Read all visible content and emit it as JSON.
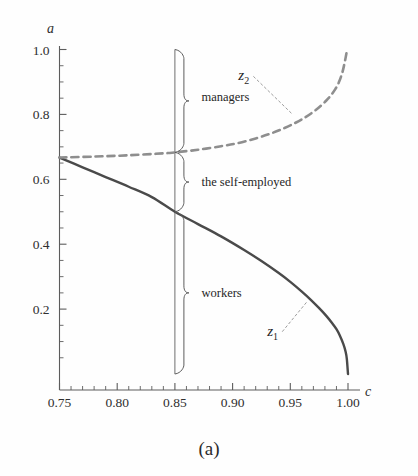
{
  "figure": {
    "caption": "(a)",
    "background_color": "#fefefe"
  },
  "chart_data": {
    "type": "line",
    "title": "",
    "xlabel": "c",
    "ylabel": "a",
    "xlim": [
      0.75,
      1.0
    ],
    "ylim": [
      0.0,
      1.0
    ],
    "grid": false,
    "legend_position": "inline-annotations",
    "x_ticks": [
      0.75,
      0.8,
      0.85,
      0.9,
      0.95,
      1.0
    ],
    "x_tick_labels": [
      "0.75",
      "0.80",
      "0.85",
      "0.90",
      "0.95",
      "1.00"
    ],
    "x_minor_step": 0.01,
    "y_ticks": [
      0.2,
      0.4,
      0.6,
      0.8,
      1.0
    ],
    "y_tick_labels": [
      "0.2",
      "0.4",
      "0.6",
      "0.8",
      "1.0"
    ],
    "y_minor_step": 0.05,
    "series": [
      {
        "name": "z1",
        "label": "z",
        "subscript": "1",
        "style": "solid",
        "color": "#4a4a4a",
        "width": 2.4,
        "x": [
          0.75,
          0.77,
          0.79,
          0.81,
          0.83,
          0.85,
          0.87,
          0.89,
          0.91,
          0.925,
          0.94,
          0.95,
          0.96,
          0.968,
          0.975,
          0.981,
          0.986,
          0.99,
          0.993,
          0.996,
          0.998,
          0.999,
          1.0
        ],
        "y": [
          0.667,
          0.637,
          0.607,
          0.577,
          0.545,
          0.5,
          0.462,
          0.424,
          0.382,
          0.348,
          0.311,
          0.284,
          0.254,
          0.228,
          0.203,
          0.18,
          0.158,
          0.138,
          0.118,
          0.092,
          0.068,
          0.046,
          0.0
        ]
      },
      {
        "name": "z2",
        "label": "z",
        "subscript": "2",
        "style": "dashed",
        "color": "#8e8e8e",
        "width": 2.6,
        "x": [
          0.75,
          0.78,
          0.81,
          0.84,
          0.85,
          0.87,
          0.89,
          0.905,
          0.92,
          0.933,
          0.945,
          0.955,
          0.963,
          0.97,
          0.976,
          0.981,
          0.985,
          0.989,
          0.992,
          0.995,
          0.997,
          0.999
        ],
        "y": [
          0.667,
          0.67,
          0.674,
          0.68,
          0.683,
          0.691,
          0.702,
          0.712,
          0.726,
          0.741,
          0.758,
          0.775,
          0.791,
          0.808,
          0.825,
          0.842,
          0.858,
          0.878,
          0.898,
          0.928,
          0.958,
          0.995
        ]
      }
    ],
    "vertical_line": {
      "name": "c-threshold",
      "x": 0.85,
      "y_from": 0.0,
      "y_to": 1.0,
      "color": "#6f6f6f"
    },
    "annotations": [
      {
        "name": "managers",
        "text": "managers",
        "brace_x": 0.85,
        "brace_y_from": 0.683,
        "brace_y_to": 1.0,
        "label_x": 0.873,
        "label_y": 0.855
      },
      {
        "name": "the-self-employed",
        "text": "the self-employed",
        "brace_x": 0.85,
        "brace_y_from": 0.5,
        "brace_y_to": 0.683,
        "label_x": 0.873,
        "label_y": 0.592
      },
      {
        "name": "workers",
        "text": "workers",
        "brace_x": 0.85,
        "brace_y_from": 0.0,
        "brace_y_to": 0.5,
        "label_x": 0.873,
        "label_y": 0.25
      }
    ],
    "curve_labels": [
      {
        "name": "z2-label",
        "label": "z",
        "subscript": "2",
        "label_x": 0.905,
        "label_y": 0.905,
        "leader_to_x": 0.952,
        "leader_to_y": 0.8
      },
      {
        "name": "z1-label",
        "label": "z",
        "subscript": "1",
        "label_x": 0.93,
        "label_y": 0.118,
        "leader_to_x": 0.965,
        "leader_to_y": 0.225
      }
    ]
  }
}
